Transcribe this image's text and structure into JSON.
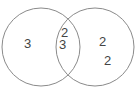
{
  "diagram": {
    "type": "venn",
    "stroke_color": "#8a8a8a",
    "text_color": "#444444",
    "circles": [
      {
        "name": "left",
        "cx": 41,
        "cy": 47,
        "r": 39
      },
      {
        "name": "right",
        "cx": 95,
        "cy": 47,
        "r": 39
      }
    ],
    "labels": [
      {
        "region": "left-only",
        "text": "3",
        "x": 29,
        "y": 48
      },
      {
        "region": "intersection-top",
        "text": "2",
        "x": 65,
        "y": 37
      },
      {
        "region": "intersection-bottom",
        "text": "3",
        "x": 63,
        "y": 49
      },
      {
        "region": "right-only-upper",
        "text": "2",
        "x": 103,
        "y": 46
      },
      {
        "region": "right-only-lower",
        "text": "2",
        "x": 108,
        "y": 65
      }
    ]
  }
}
